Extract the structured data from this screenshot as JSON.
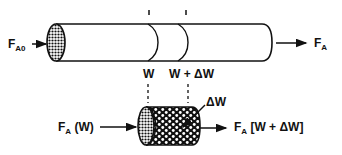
{
  "diagram": {
    "type": "packed-bed-reactor-mole-balance",
    "colors": {
      "ink": "#111111",
      "background": "#ffffff"
    },
    "top": {
      "inlet_label": {
        "main": "F",
        "sub": "A0"
      },
      "outlet_label": {
        "main": "F",
        "sub": "A"
      },
      "position_labels": [
        "W",
        "W + ΔW"
      ]
    },
    "bottom": {
      "inlet_label": {
        "main": "F",
        "sub": "A",
        "rest": " (W)"
      },
      "outlet_label": {
        "main": "F",
        "sub": "A",
        "rest": " [W + ΔW]"
      },
      "element_label": "ΔW"
    }
  }
}
